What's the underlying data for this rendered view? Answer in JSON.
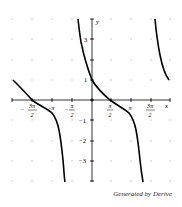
{
  "chart_data": {
    "type": "line",
    "title": "",
    "xlabel": "x",
    "ylabel": "y",
    "xlim": [
      -4.71,
      6.28
    ],
    "ylim": [
      -4,
      4
    ],
    "grid": "dots",
    "x_tick_labels": [
      "-3π/2",
      "-π",
      "-π/2",
      "π/2",
      "π",
      "3π/2"
    ],
    "y_tick_labels": [
      "3",
      "1",
      "-1",
      "-2",
      "-3"
    ],
    "series": [
      {
        "name": "branch-left",
        "points": [
          [
            -6.28,
            1
          ],
          [
            -4.71,
            0
          ],
          [
            -3.14,
            -0.65
          ],
          [
            -2.7,
            -1.5
          ],
          [
            -2.4,
            -2.7
          ],
          [
            -2.1,
            -4
          ]
        ]
      },
      {
        "name": "branch-middle",
        "points": [
          [
            -1.1,
            4
          ],
          [
            -0.95,
            3
          ],
          [
            -0.65,
            2
          ],
          [
            0,
            1
          ],
          [
            1.57,
            0
          ],
          [
            2.93,
            -0.65
          ],
          [
            3.45,
            -1.5
          ],
          [
            3.76,
            -2.7
          ],
          [
            4.0,
            -4
          ]
        ]
      },
      {
        "name": "branch-right",
        "points": [
          [
            5.0,
            4
          ],
          [
            5.5,
            2.5
          ],
          [
            6.12,
            1
          ]
        ]
      }
    ]
  },
  "footer": {
    "credit": "Generated by Derive"
  }
}
